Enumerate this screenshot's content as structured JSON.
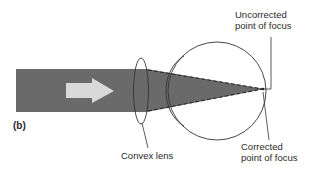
{
  "figure": {
    "panel_label": "(b)",
    "labels": {
      "uncorrected_line1": "Uncorrected",
      "uncorrected_line2": "point of focus",
      "corrected_line1": "Corrected",
      "corrected_line2": "point of focus",
      "lens": "Convex lens"
    },
    "colors": {
      "beam": "#6a6a6a",
      "arrow": "#d9d9d9",
      "outline": "#333333",
      "background": "#ffffff"
    }
  }
}
